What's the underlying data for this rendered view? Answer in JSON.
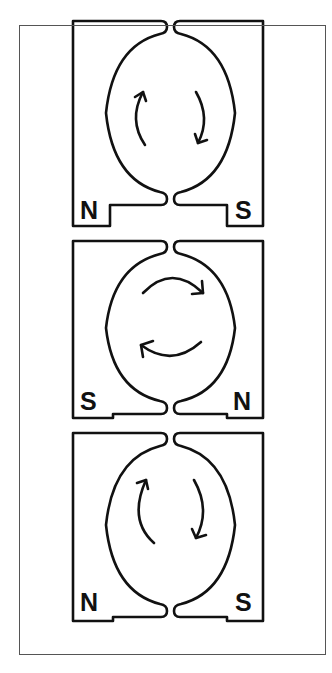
{
  "diagram": {
    "type": "motor-magnet-field-sequence",
    "stages": [
      {
        "index": 1,
        "left_pole": "N",
        "right_pole": "S",
        "rotation": "left-up / right-down (vertical arcs)"
      },
      {
        "index": 2,
        "left_pole": "S",
        "right_pole": "N",
        "rotation": "top-right / bottom-left (horizontal arcs)"
      },
      {
        "index": 3,
        "left_pole": "N",
        "right_pole": "S",
        "rotation": "left-up / right-down (vertical arcs)"
      }
    ]
  },
  "colors": {
    "stroke": "#111111",
    "background": "#ffffff",
    "frame": "#555555"
  }
}
